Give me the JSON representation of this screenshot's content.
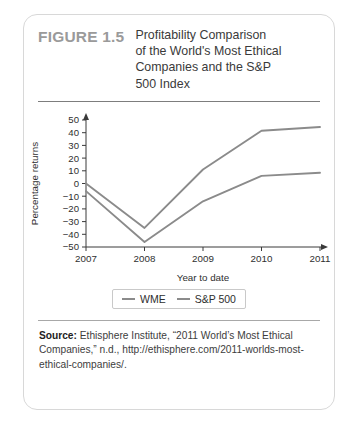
{
  "figure": {
    "number_label": "FIGURE 1.5",
    "title": "Profitability Comparison of the World's Most Ethical Companies and the S&P 500 Index",
    "title_lines": [
      "Profitability Comparison",
      "of the World's Most Ethical",
      "Companies and the S&P",
      "500 Index"
    ]
  },
  "source": {
    "label": "Source:",
    "text": "Ethisphere Institute, “2011 World’s Most Ethical Companies,” n.d., http://ethisphere.com/2011-worlds-most-ethical-companies/."
  },
  "colors": {
    "line_wme": "#8b8b8b",
    "line_sp500": "#8b8b8b",
    "axis": "#3a3a3a",
    "card_border": "#d8d8d8",
    "figure_number": "#9a9a9a",
    "title_text": "#3a3a3a"
  },
  "chart_data": {
    "type": "line",
    "title": "",
    "xlabel": "Year to date",
    "ylabel": "Percentage returns",
    "x": [
      "2007",
      "2008",
      "2009",
      "2010",
      "2011"
    ],
    "xtick_labels": [
      "2007",
      "2008",
      "2009",
      "2010",
      "2011"
    ],
    "ytick_labels": [
      "50",
      "40",
      "30",
      "20",
      "10",
      "0",
      "−10",
      "−20",
      "−30",
      "−40",
      "−50"
    ],
    "ytick_values": [
      50,
      40,
      30,
      20,
      10,
      0,
      -10,
      -20,
      -30,
      -40,
      -50
    ],
    "ylim": [
      -50,
      50
    ],
    "grid": false,
    "legend_position": "bottom-center",
    "series": [
      {
        "name": "WME",
        "values": [
          0,
          -35,
          11,
          41.5,
          44.5
        ]
      },
      {
        "name": "S&P 500",
        "values": [
          -6,
          -46,
          -14,
          6,
          8.5
        ]
      }
    ]
  }
}
